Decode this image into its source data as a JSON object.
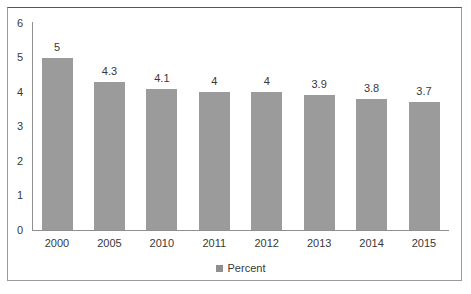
{
  "chart_data": {
    "type": "bar",
    "categories": [
      "2000",
      "2005",
      "2010",
      "2011",
      "2012",
      "2013",
      "2014",
      "2015"
    ],
    "values": [
      5,
      4.3,
      4.1,
      4,
      4,
      3.9,
      3.8,
      3.7
    ],
    "value_labels": [
      "5",
      "4.3",
      "4.1",
      "4",
      "4",
      "3.9",
      "3.8",
      "3.7"
    ],
    "title": "",
    "xlabel": "",
    "ylabel": "",
    "ylim": [
      0,
      6
    ],
    "yticks": [
      "0",
      "1",
      "2",
      "3",
      "4",
      "5",
      "6"
    ],
    "grid": false,
    "legend_position": "bottom-center",
    "legend": [
      {
        "label": "Percent",
        "color": "#8f8f8f"
      }
    ],
    "colors": {
      "bar": "#9b9b9b",
      "axis": "#8f8f8f",
      "text": "#383838",
      "panel_border": "#9a9a9a",
      "background": "#ffffff"
    }
  }
}
